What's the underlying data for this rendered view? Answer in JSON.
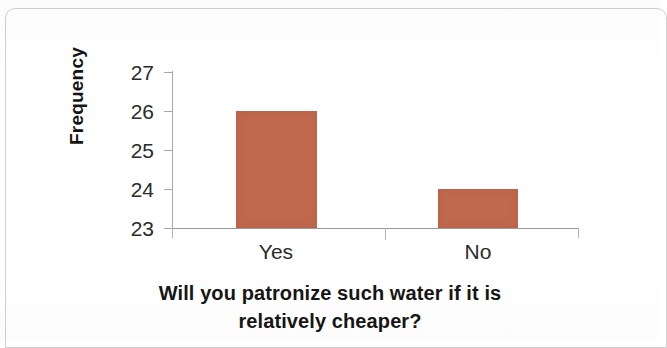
{
  "chart_data": {
    "type": "bar",
    "title": "",
    "xlabel": "Will you patronize such water if it is relatively cheaper?",
    "xlabel_line1": "Will you patronize such water if it is",
    "xlabel_line2": "relatively cheaper?",
    "ylabel": "Frequency",
    "categories": [
      "Yes",
      "No"
    ],
    "values": [
      26,
      24
    ],
    "ylim": [
      23,
      27
    ],
    "yticks": [
      27,
      26,
      25,
      24,
      23
    ],
    "ytick_labels": [
      "27",
      "26",
      "25",
      "24",
      "23"
    ],
    "grid": false,
    "legend": false,
    "bar_color": "#C1694F",
    "axis_color": "#A8A8A8",
    "text_color": "#2B2B2B"
  },
  "frame": {
    "border_color": "#CFCFCF"
  },
  "bars": [
    {
      "category": "Yes",
      "value": 26,
      "value_label": "26"
    },
    {
      "category": "No",
      "value": 24,
      "value_label": "24"
    }
  ]
}
